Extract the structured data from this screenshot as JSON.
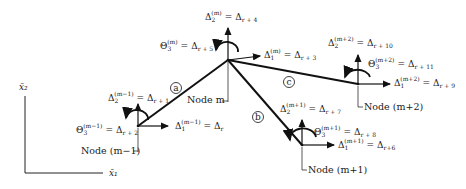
{
  "diagram": {
    "type": "frame-structure-degrees-of-freedom",
    "axes": {
      "x1": "x̄₁",
      "x2": "x̄₂"
    },
    "members": [
      {
        "id": "a",
        "from": "Node (m−1)",
        "to": "Node m"
      },
      {
        "id": "b",
        "from": "Node m",
        "to": "Node (m+1)"
      },
      {
        "id": "c",
        "from": "Node m",
        "to": "Node (m+2)"
      }
    ],
    "nodes": {
      "m_minus_1": {
        "label": "Node (m−1)",
        "d1": {
          "sym": "Δ",
          "sub": "1",
          "sup": "(m−1)",
          "rhs": "Δ",
          "rsub": "r"
        },
        "d2": {
          "sym": "Δ",
          "sub": "2",
          "sup": "(m−1)",
          "rhs": "Δ",
          "rsub": "r + 1"
        },
        "t3": {
          "sym": "Θ",
          "sub": "3",
          "sup": "(m−1)",
          "rhs": "Δ",
          "rsub": "r + 2"
        }
      },
      "m": {
        "label": "Node m",
        "d1": {
          "sym": "Δ",
          "sub": "1",
          "sup": "(m)",
          "rhs": "Δ",
          "rsub": "r + 3"
        },
        "d2": {
          "sym": "Δ",
          "sub": "2",
          "sup": "(m)",
          "rhs": "Δ",
          "rsub": "r + 4"
        },
        "t3": {
          "sym": "Θ",
          "sub": "3",
          "sup": "(m)",
          "rhs": "Δ",
          "rsub": "r + 5"
        }
      },
      "m_plus_1": {
        "label": "Node (m+1)",
        "d1": {
          "sym": "Δ",
          "sub": "1",
          "sup": "(m+1)",
          "rhs": "Δ",
          "rsub": "r+6"
        },
        "d2": {
          "sym": "Δ",
          "sub": "2",
          "sup": "(m+1)",
          "rhs": "Δ",
          "rsub": "r + 7"
        },
        "t3": {
          "sym": "Θ",
          "sub": "3",
          "sup": "(m+1)",
          "rhs": "Δ",
          "rsub": "r + 8"
        }
      },
      "m_plus_2": {
        "label": "Node (m+2)",
        "d1": {
          "sym": "Δ",
          "sub": "1",
          "sup": "(m+2)",
          "rhs": "Δ",
          "rsub": "r + 9"
        },
        "d2": {
          "sym": "Δ",
          "sub": "2",
          "sup": "(m+2)",
          "rhs": "Δ",
          "rsub": "r + 10"
        },
        "t3": {
          "sym": "Θ",
          "sub": "3",
          "sup": "(m+2)",
          "rhs": "Δ",
          "rsub": "r + 11"
        }
      }
    },
    "eq": "="
  }
}
